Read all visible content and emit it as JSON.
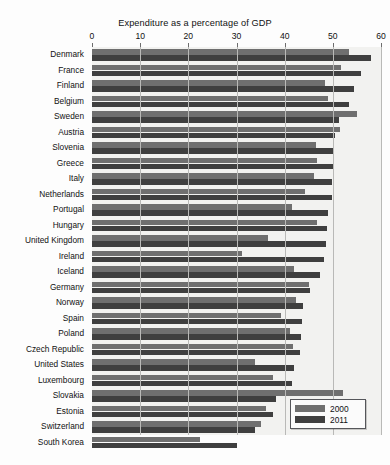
{
  "chart_data": {
    "type": "bar",
    "orientation": "horizontal",
    "title": "Expenditure as a percentage of GDP",
    "xlabel": "",
    "ylabel": "",
    "xlim": [
      0,
      60
    ],
    "xticks": [
      0,
      10,
      20,
      30,
      40,
      50,
      60
    ],
    "xtick_labels": [
      "0",
      "10",
      "20",
      "30",
      "40",
      "50",
      "60"
    ],
    "grid": true,
    "grid_axis": "x",
    "legend_position": "bottom-right",
    "categories": [
      "Denmark",
      "France",
      "Finland",
      "Belgium",
      "Sweden",
      "Austria",
      "Slovenia",
      "Greece",
      "Italy",
      "Netherlands",
      "Portugal",
      "Hungary",
      "United Kingdom",
      "Ireland",
      "Iceland",
      "Germany",
      "Norway",
      "Spain",
      "Poland",
      "Czech Republic",
      "United States",
      "Luxembourg",
      "Slovakia",
      "Estonia",
      "Switzerland",
      "South Korea"
    ],
    "series": [
      {
        "name": "2000",
        "color": "#6f6f6f",
        "values": [
          53.4,
          51.6,
          48.3,
          49.1,
          55.1,
          51.4,
          46.5,
          46.7,
          46.1,
          44.2,
          41.6,
          46.8,
          36.6,
          31.2,
          41.9,
          45.1,
          42.3,
          39.2,
          41.1,
          41.8,
          33.9,
          37.6,
          52.1,
          36.1,
          35.1,
          22.4
        ]
      },
      {
        "name": "2011",
        "color": "#3f3f3f",
        "values": [
          57.9,
          55.9,
          54.4,
          53.4,
          51.3,
          50.5,
          50.0,
          50.1,
          49.9,
          49.8,
          48.9,
          48.7,
          48.6,
          48.1,
          47.3,
          45.3,
          43.9,
          43.6,
          43.4,
          43.2,
          41.9,
          41.6,
          38.3,
          37.5,
          33.8,
          30.2
        ]
      }
    ]
  },
  "legend": {
    "items": [
      {
        "label": "2000",
        "color": "#6f6f6f"
      },
      {
        "label": "2011",
        "color": "#3f3f3f"
      }
    ]
  },
  "caption": ""
}
